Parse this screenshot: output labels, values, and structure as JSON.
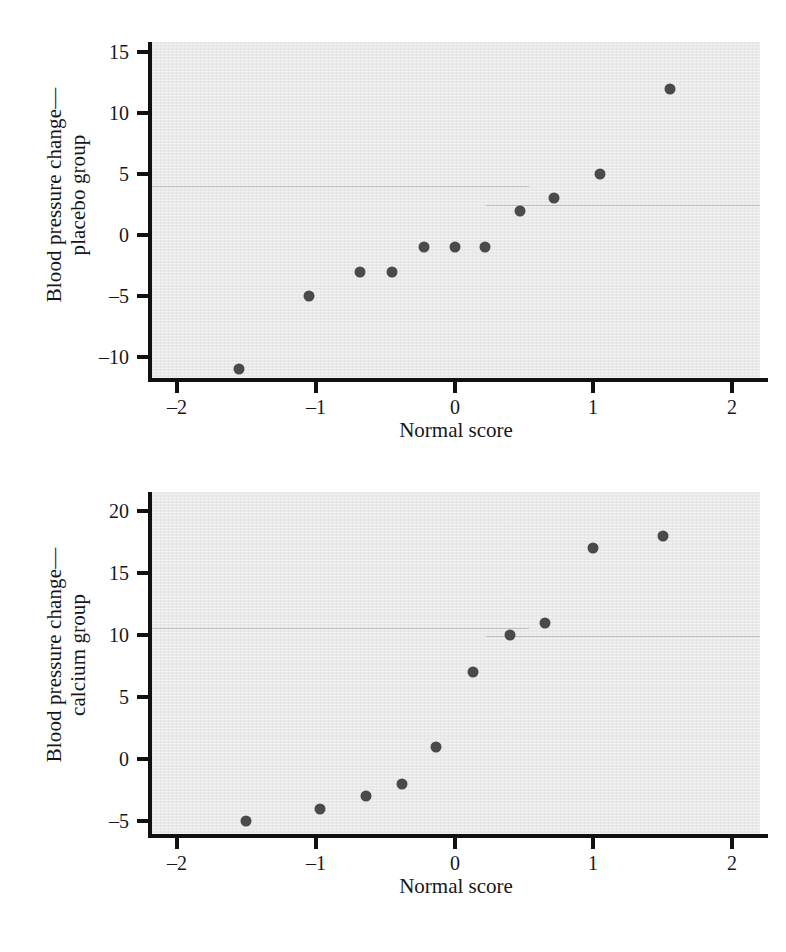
{
  "page": {
    "background": "#ffffff",
    "plot_background": "#e9e9e9",
    "marker_color": "#4a4a4c",
    "axis_color": "#111111",
    "text_color": "#17171a"
  },
  "chart_data": [
    {
      "type": "scatter",
      "id": "placebo-normal-probability-plot",
      "title": "",
      "xlabel": "Normal score",
      "ylabel": "Blood pressure change—\nplacebo group",
      "ylabel_line1": "Blood pressure change—",
      "ylabel_line2": "placebo group",
      "xlim": [
        -2.18,
        2.2
      ],
      "ylim": [
        -12.1,
        15.8
      ],
      "xticks": [
        -2,
        -1,
        0,
        1,
        2
      ],
      "xticklabels": [
        "–2",
        "–1",
        "0",
        "1",
        "2"
      ],
      "yticks": [
        15,
        10,
        5,
        0,
        -5,
        -10
      ],
      "yticklabels": [
        "15",
        "10",
        "5",
        "0",
        "–5",
        "–10"
      ],
      "grid": false,
      "legend": "none",
      "x": [
        -1.55,
        -1.05,
        -0.68,
        -0.45,
        -0.22,
        0.0,
        0.22,
        0.47,
        0.72,
        1.05,
        1.55
      ],
      "y": [
        -11,
        -5,
        -3,
        -3,
        -1,
        -1,
        -1,
        2,
        3,
        5,
        12
      ],
      "points": [
        {
          "x": -1.55,
          "y": -11
        },
        {
          "x": -1.05,
          "y": -5
        },
        {
          "x": -0.68,
          "y": -3
        },
        {
          "x": -0.45,
          "y": -3
        },
        {
          "x": -0.22,
          "y": -1
        },
        {
          "x": 0.0,
          "y": -1
        },
        {
          "x": 0.22,
          "y": -1
        },
        {
          "x": 0.47,
          "y": 2
        },
        {
          "x": 0.72,
          "y": 3
        },
        {
          "x": 1.05,
          "y": 5
        },
        {
          "x": 1.55,
          "y": 12
        }
      ]
    },
    {
      "type": "scatter",
      "id": "calcium-normal-probability-plot",
      "title": "",
      "xlabel": "Normal score",
      "ylabel": "Blood pressure change—\ncalcium group",
      "ylabel_line1": "Blood pressure change—",
      "ylabel_line2": "calcium group",
      "xlim": [
        -2.18,
        2.2
      ],
      "ylim": [
        -6.2,
        21.2
      ],
      "xticks": [
        -2,
        -1,
        0,
        1,
        2
      ],
      "xticklabels": [
        "–2",
        "–1",
        "0",
        "1",
        "2"
      ],
      "yticks": [
        20,
        15,
        10,
        5,
        0,
        -5
      ],
      "yticklabels": [
        "20",
        "15",
        "10",
        "5",
        "0",
        "–5"
      ],
      "grid": false,
      "legend": "none",
      "x": [
        -1.5,
        -0.97,
        -0.64,
        -0.38,
        -0.13,
        0.13,
        0.4,
        0.65,
        1.0,
        1.5
      ],
      "y": [
        -5,
        -4,
        -3,
        -2,
        1,
        7,
        10,
        11,
        17,
        18
      ],
      "points": [
        {
          "x": -1.5,
          "y": -5
        },
        {
          "x": -0.97,
          "y": -4
        },
        {
          "x": -0.64,
          "y": -3
        },
        {
          "x": -0.38,
          "y": -2
        },
        {
          "x": -0.13,
          "y": 1
        },
        {
          "x": 0.13,
          "y": 7
        },
        {
          "x": 0.4,
          "y": 10
        },
        {
          "x": 0.65,
          "y": 11
        },
        {
          "x": 1.0,
          "y": 17
        },
        {
          "x": 1.5,
          "y": 18
        }
      ]
    }
  ]
}
